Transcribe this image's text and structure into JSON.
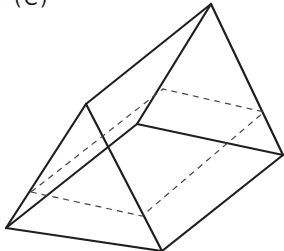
{
  "figure": {
    "label": "(C)",
    "colors": {
      "line": "#1f1f1f",
      "dashed": "#444444",
      "background": "#ffffff"
    },
    "vertices": {
      "apex": [
        211,
        4
      ],
      "front_top": [
        86,
        104
      ],
      "left": [
        6,
        228
      ],
      "bottom": [
        162,
        251
      ],
      "middle": [
        137,
        124
      ],
      "right": [
        283,
        155
      ]
    },
    "solid_edges": [
      [
        "apex",
        "front_top"
      ],
      [
        "apex",
        "middle"
      ],
      [
        "apex",
        "right"
      ],
      [
        "front_top",
        "left"
      ],
      [
        "front_top",
        "bottom"
      ],
      [
        "left",
        "middle"
      ],
      [
        "middle",
        "right"
      ],
      [
        "left",
        "bottom"
      ],
      [
        "bottom",
        "right"
      ]
    ],
    "dashed_section": [
      [
        31,
        192
      ],
      [
        163,
        89
      ],
      [
        264,
        112
      ],
      [
        142,
        216
      ]
    ]
  }
}
